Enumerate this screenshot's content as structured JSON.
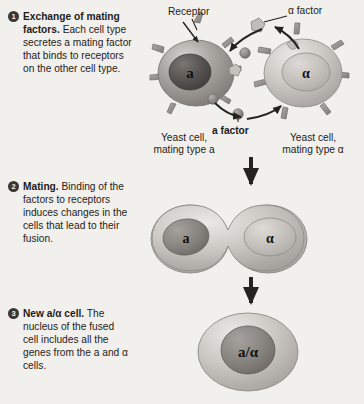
{
  "figure": {
    "background_color": "#f2f0ec",
    "ink_color": "#1e1c1b"
  },
  "steps": [
    {
      "number": "1",
      "heading": "Exchange of mating factors.",
      "text": "Each cell type secretes a mating factor that binds to receptors on the other cell type."
    },
    {
      "number": "2",
      "heading": "Mating.",
      "text": "Binding of the factors to receptors induces changes in the cells that lead to their fusion."
    },
    {
      "number": "3",
      "heading": "New a/α cell.",
      "text": "The nucleus of the fused cell includes all the genes from the a and α cells."
    }
  ],
  "labels": {
    "receptor": "Receptor",
    "alpha_factor": "α factor",
    "a_factor": "a factor",
    "yeast_cell_a_line1": "Yeast cell,",
    "yeast_cell_a_line2": "mating type a",
    "yeast_cell_alpha_line1": "Yeast cell,",
    "yeast_cell_alpha_line2": "mating type α"
  },
  "cells": {
    "stage1_left_nucleus": "a",
    "stage1_right_nucleus": "α",
    "stage2_left_nucleus": "a",
    "stage2_right_nucleus": "α",
    "stage3_nucleus": "a/α"
  },
  "colors": {
    "cell_dark_fill": "#8e8b86",
    "cell_light_fill": "#c9c6c1",
    "nucleus_dark_fill": "#595654",
    "nucleus_light_fill": "#bdbab5",
    "receptor_fill": "#95918c",
    "arrow_color": "#26231f",
    "badge_fill": "#3a3734",
    "badge_text": "#f4f2ee"
  }
}
